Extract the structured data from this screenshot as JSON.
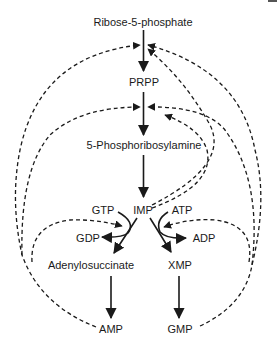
{
  "diagram": {
    "nodes": {
      "r5p": "Ribose-5-phosphate",
      "prpp": "PRPP",
      "pra": "5-Phosphoribosylamine",
      "imp": "IMP",
      "gtp": "GTP",
      "atp": "ATP",
      "gdp": "GDP",
      "adp": "ADP",
      "adenylosuccinate": "Adenylosuccinate",
      "xmp": "XMP",
      "amp": "AMP",
      "gmp": "GMP"
    },
    "edges": {
      "solid": [
        [
          "Ribose-5-phosphate",
          "PRPP"
        ],
        [
          "PRPP",
          "5-Phosphoribosylamine"
        ],
        [
          "5-Phosphoribosylamine",
          "IMP"
        ],
        [
          "IMP",
          "Adenylosuccinate"
        ],
        [
          "GTP",
          "GDP"
        ],
        [
          "IMP",
          "XMP"
        ],
        [
          "ATP",
          "ADP"
        ],
        [
          "Adenylosuccinate",
          "AMP"
        ],
        [
          "XMP",
          "GMP"
        ]
      ],
      "dashed_feedback": [
        [
          "AMP",
          "Ribose-5-phosphate→PRPP"
        ],
        [
          "AMP",
          "PRPP→5-Phosphoribosylamine"
        ],
        [
          "AMP",
          "IMP→Adenylosuccinate"
        ],
        [
          "IMP",
          "Ribose-5-phosphate→PRPP"
        ],
        [
          "IMP",
          "PRPP→5-Phosphoribosylamine"
        ],
        [
          "GMP",
          "Ribose-5-phosphate→PRPP"
        ],
        [
          "GMP",
          "PRPP→5-Phosphoribosylamine"
        ],
        [
          "GMP",
          "IMP→XMP"
        ]
      ]
    },
    "colors": {
      "stroke": "#1a1a1a",
      "background": "#ffffff"
    }
  }
}
